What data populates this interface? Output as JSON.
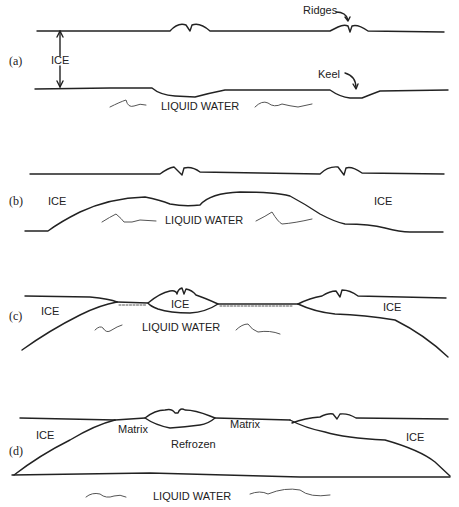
{
  "figure": {
    "panels": [
      {
        "id": "a",
        "label": "(a)",
        "ice_label": "ICE",
        "water_label": "LIQUID WATER",
        "annotations": {
          "ridges": "Ridges",
          "keel": "Keel"
        }
      },
      {
        "id": "b",
        "label": "(b)",
        "ice_left": "ICE",
        "ice_right": "ICE",
        "water_label": "LIQUID WATER"
      },
      {
        "id": "c",
        "label": "(c)",
        "ice_left": "ICE",
        "ice_center": "ICE",
        "ice_right": "ICE",
        "water_label": "LIQUID WATER"
      },
      {
        "id": "d",
        "label": "(d)",
        "ice_left": "ICE",
        "ice_right": "ICE",
        "matrix_left": "Matrix",
        "matrix_right": "Matrix",
        "refrozen": "Refrozen",
        "water_label": "LIQUID WATER"
      }
    ]
  }
}
